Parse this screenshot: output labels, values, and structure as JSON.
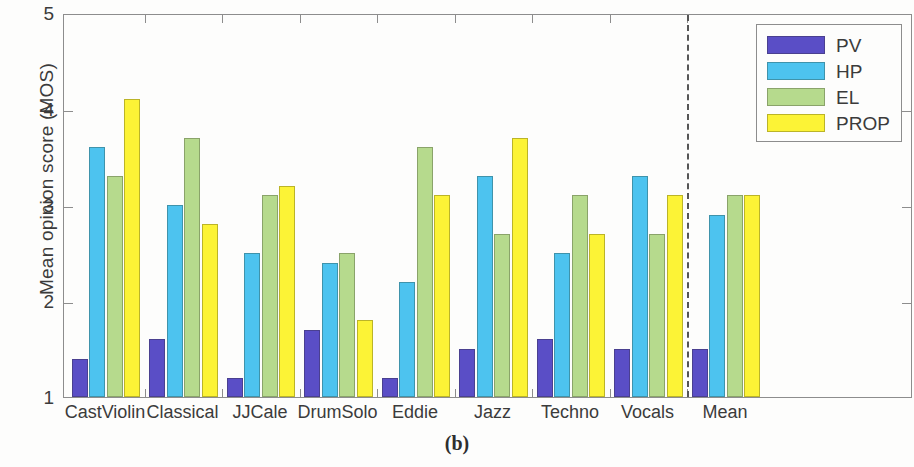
{
  "caption": "(b)",
  "legend": {
    "position": "top-right",
    "entries": [
      {
        "label": "PV",
        "color": "#5a4ec6",
        "key": "pv"
      },
      {
        "label": "HP",
        "color": "#4dc3ef",
        "key": "hp"
      },
      {
        "label": "EL",
        "color": "#b6da8d",
        "key": "el"
      },
      {
        "label": "PROP",
        "color": "#fcf336",
        "key": "prop"
      }
    ]
  },
  "axes": {
    "ylabel": "Mean opinion score (MOS)",
    "yticks": [
      "1",
      "2",
      "3",
      "4",
      "5"
    ],
    "xlabel": ""
  },
  "annotations": {
    "divider": "dashed vertical separator before Mean"
  },
  "chart_data": {
    "type": "bar",
    "title": "",
    "xlabel": "",
    "ylabel": "Mean opinion score (MOS)",
    "ylim": [
      1,
      5
    ],
    "yticks": [
      1,
      2,
      3,
      4,
      5
    ],
    "grid": false,
    "legend_position": "top-right",
    "categories": [
      "CastViolin",
      "Classical",
      "JJCale",
      "DrumSolo",
      "Eddie",
      "Jazz",
      "Techno",
      "Vocals",
      "Mean"
    ],
    "series": [
      {
        "name": "PV",
        "color": "#5a4ec6",
        "values": [
          1.4,
          1.6,
          1.2,
          1.7,
          1.2,
          1.5,
          1.6,
          1.5,
          1.5
        ]
      },
      {
        "name": "HP",
        "color": "#4dc3ef",
        "values": [
          3.6,
          3.0,
          2.5,
          2.4,
          2.2,
          3.3,
          2.5,
          3.3,
          2.9
        ]
      },
      {
        "name": "EL",
        "color": "#b6da8d",
        "values": [
          3.3,
          3.7,
          3.1,
          2.5,
          3.6,
          2.7,
          3.1,
          2.7,
          3.1
        ]
      },
      {
        "name": "PROP",
        "color": "#fcf336",
        "values": [
          4.1,
          2.8,
          3.2,
          1.8,
          3.1,
          3.7,
          2.7,
          3.1,
          3.1
        ]
      }
    ],
    "annotations": [
      {
        "type": "vline",
        "style": "dashed",
        "after_category": "Vocals"
      }
    ]
  }
}
